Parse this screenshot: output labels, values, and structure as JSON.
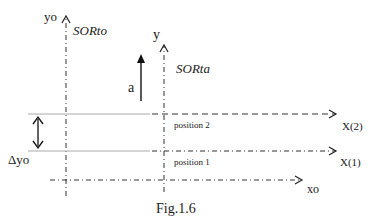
{
  "diagram": {
    "caption": "Fig.1.6",
    "axes": {
      "yo": {
        "label": "yo"
      },
      "y": {
        "label": "y"
      },
      "xo": {
        "label": "xo"
      },
      "x1": {
        "label": "X(1)"
      },
      "x2": {
        "label": "X(2)"
      }
    },
    "frames": {
      "fixed": "SORto",
      "moving": "SORta"
    },
    "acceleration": {
      "label": "a"
    },
    "displacement": {
      "label": "Δyo"
    },
    "positions": [
      {
        "label": "position 2"
      },
      {
        "label": "position 1"
      }
    ],
    "colors": {
      "line": "#222222",
      "reference_line": "#999999"
    }
  }
}
